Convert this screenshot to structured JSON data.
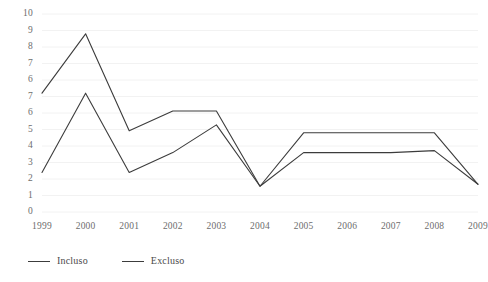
{
  "chart_data": {
    "type": "line",
    "title": "",
    "xlabel": "",
    "ylabel": "",
    "categories": [
      "1999",
      "2000",
      "2001",
      "2002",
      "2003",
      "2004",
      "2005",
      "2006",
      "2007",
      "2008",
      "2009"
    ],
    "y_tick_labels": [
      "10",
      "9",
      "8",
      "7",
      "6",
      "7",
      "6",
      "5",
      "4",
      "3",
      "2",
      "1",
      "0"
    ],
    "ylim": [
      0,
      10
    ],
    "grid": true,
    "legend_position": "bottom-left",
    "series": [
      {
        "name": "Incluso",
        "color": "#3c3c3c",
        "values": [
          2,
          6,
          2,
          3,
          4.4,
          1.3,
          3,
          3,
          3,
          3.1,
          1.4
        ]
      },
      {
        "name": "Excluso",
        "color": "#3c3c3c",
        "values": [
          6,
          9,
          4.1,
          5.1,
          5.1,
          1.3,
          4,
          4,
          4,
          4,
          1.4
        ]
      }
    ]
  },
  "style": {
    "grid_color": "#f2f2f2",
    "axis_text_color": "#6d6d6d",
    "background": "#ffffff"
  }
}
